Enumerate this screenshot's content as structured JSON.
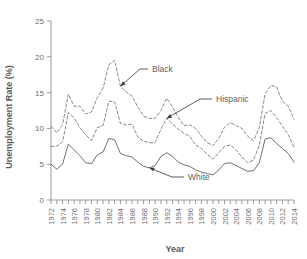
{
  "chart_data": {
    "type": "line",
    "title": "",
    "xlabel": "Year",
    "ylabel": "Unemployment Rate (%)",
    "xlim": [
      1972,
      2014
    ],
    "ylim": [
      0,
      25
    ],
    "yticks": [
      0,
      5,
      10,
      15,
      20,
      25
    ],
    "grid": false,
    "legend_position": "inline-annotations",
    "x": [
      1972,
      1973,
      1974,
      1975,
      1976,
      1977,
      1978,
      1979,
      1980,
      1981,
      1982,
      1983,
      1984,
      1985,
      1986,
      1987,
      1988,
      1989,
      1990,
      1991,
      1992,
      1993,
      1994,
      1995,
      1996,
      1997,
      1998,
      1999,
      2000,
      2001,
      2002,
      2003,
      2004,
      2005,
      2006,
      2007,
      2008,
      2009,
      2010,
      2011,
      2012,
      2013,
      2014
    ],
    "xtick_labels": [
      "1972",
      "1973",
      "1974",
      "1975",
      "1976",
      "1977",
      "1978",
      "1979",
      "1980",
      "1981",
      "1982",
      "1983",
      "1984",
      "1985",
      "1986",
      "1987",
      "1988",
      "1989",
      "1990",
      "1991",
      "1992",
      "1993",
      "1994",
      "1995",
      "1996",
      "1997",
      "1998",
      "1999",
      "2000",
      "2001",
      "2002",
      "2003",
      "2004",
      "2005",
      "2006",
      "2007",
      "2008",
      "2009",
      "2010",
      "2011",
      "2012",
      "2013",
      "2014"
    ],
    "xtick_labels_shown": [
      "1972",
      "1974",
      "1976",
      "1978",
      "1980",
      "1982",
      "1984",
      "1986",
      "1988",
      "1990",
      "1992",
      "1994",
      "1996",
      "1998",
      "2000",
      "2002",
      "2004",
      "2006",
      "2008",
      "2010",
      "2012",
      "2014"
    ],
    "series": [
      {
        "name": "Black",
        "style": "dashed",
        "color": "#8a8a8a",
        "values": [
          10.3,
          9.4,
          10.5,
          14.8,
          13.1,
          13.1,
          12.0,
          12.3,
          14.3,
          15.6,
          18.9,
          19.5,
          15.9,
          15.1,
          14.5,
          13.0,
          11.7,
          11.4,
          11.4,
          12.5,
          14.2,
          13.0,
          11.5,
          10.4,
          10.5,
          10.0,
          8.9,
          8.0,
          7.6,
          8.6,
          10.2,
          10.8,
          10.4,
          10.0,
          8.9,
          8.3,
          10.1,
          14.8,
          16.0,
          15.8,
          13.8,
          13.1,
          11.3
        ]
      },
      {
        "name": "Hispanic",
        "style": "dashed",
        "color": "#8a8a8a",
        "values": [
          7.5,
          7.5,
          8.1,
          12.2,
          11.5,
          10.1,
          9.1,
          8.3,
          10.1,
          10.4,
          13.8,
          13.7,
          10.7,
          10.5,
          10.6,
          8.8,
          8.2,
          8.0,
          8.0,
          9.9,
          11.4,
          10.6,
          9.9,
          9.3,
          8.9,
          7.7,
          7.2,
          6.4,
          5.7,
          6.6,
          7.5,
          7.7,
          7.0,
          6.0,
          5.2,
          5.6,
          7.6,
          12.1,
          12.5,
          11.5,
          10.3,
          9.1,
          7.4
        ]
      },
      {
        "name": "White",
        "style": "solid",
        "color": "#6f6f6f",
        "values": [
          5.0,
          4.3,
          5.0,
          7.8,
          7.0,
          6.2,
          5.2,
          5.1,
          6.3,
          6.7,
          8.6,
          8.4,
          6.5,
          6.2,
          6.0,
          5.3,
          4.7,
          4.5,
          4.8,
          6.1,
          6.6,
          6.1,
          5.3,
          4.9,
          4.7,
          4.2,
          3.9,
          3.7,
          3.5,
          4.2,
          5.1,
          5.2,
          4.8,
          4.4,
          4.0,
          4.1,
          5.2,
          8.5,
          8.7,
          7.9,
          7.2,
          6.5,
          5.3
        ]
      }
    ],
    "annotations": [
      {
        "label": "Black",
        "point_year": 1984,
        "point_value": 15.9
      },
      {
        "label": "Hispanic",
        "point_year": 1992,
        "point_value": 11.4
      },
      {
        "label": "White",
        "point_year": 1989,
        "point_value": 4.5
      }
    ]
  }
}
